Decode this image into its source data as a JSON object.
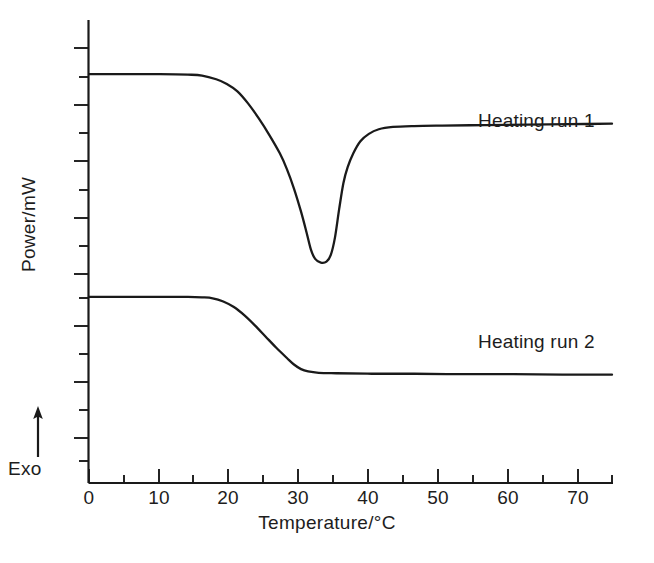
{
  "chart_data": {
    "type": "line",
    "title": "",
    "xlabel": "Temperature/°C",
    "ylabel": "Power/mW",
    "xlim": [
      0,
      74
    ],
    "ylim": [
      0,
      10
    ],
    "grid": false,
    "legend_position": "inline-right",
    "x_ticks": [
      0,
      10,
      20,
      30,
      40,
      50,
      60,
      70
    ],
    "x_tick_labels": [
      "0",
      "10",
      "20",
      "30",
      "40",
      "50",
      "60",
      "70"
    ],
    "x_minor_tick_interval": 5,
    "y_ticks_labeled": false,
    "y_tick_count": 17,
    "annotations": [
      {
        "text": "Exo",
        "icon": "up-arrow-icon",
        "meaning": "exothermic direction is upward"
      }
    ],
    "series": [
      {
        "name": "Heating run 1",
        "label": "Heating run 1",
        "color": "#1a1a1a",
        "points": [
          [
            0.0,
            8.83
          ],
          [
            5.0,
            8.83
          ],
          [
            10.0,
            8.83
          ],
          [
            14.0,
            8.82
          ],
          [
            16.0,
            8.8
          ],
          [
            18.0,
            8.72
          ],
          [
            19.5,
            8.62
          ],
          [
            21.0,
            8.46
          ],
          [
            22.5,
            8.2
          ],
          [
            24.0,
            7.88
          ],
          [
            25.5,
            7.52
          ],
          [
            27.0,
            7.12
          ],
          [
            28.0,
            6.78
          ],
          [
            29.0,
            6.36
          ],
          [
            30.0,
            5.86
          ],
          [
            30.8,
            5.4
          ],
          [
            31.4,
            5.04
          ],
          [
            32.0,
            4.84
          ],
          [
            32.8,
            4.76
          ],
          [
            33.6,
            4.78
          ],
          [
            34.2,
            4.92
          ],
          [
            34.8,
            5.3
          ],
          [
            35.4,
            5.92
          ],
          [
            36.0,
            6.48
          ],
          [
            36.6,
            6.82
          ],
          [
            37.4,
            7.12
          ],
          [
            38.4,
            7.38
          ],
          [
            39.6,
            7.54
          ],
          [
            41.0,
            7.64
          ],
          [
            43.0,
            7.69
          ],
          [
            46.0,
            7.71
          ],
          [
            50.0,
            7.72
          ],
          [
            56.0,
            7.73
          ],
          [
            62.0,
            7.74
          ],
          [
            68.0,
            7.75
          ],
          [
            74.0,
            7.76
          ]
        ]
      },
      {
        "name": "Heating run 2",
        "label": "Heating run 2",
        "color": "#1a1a1a",
        "points": [
          [
            0.0,
            4.02
          ],
          [
            5.0,
            4.02
          ],
          [
            10.0,
            4.02
          ],
          [
            14.0,
            4.02
          ],
          [
            16.0,
            4.01
          ],
          [
            17.5,
            3.99
          ],
          [
            19.0,
            3.92
          ],
          [
            20.5,
            3.8
          ],
          [
            22.0,
            3.62
          ],
          [
            23.5,
            3.4
          ],
          [
            25.0,
            3.16
          ],
          [
            26.5,
            2.92
          ],
          [
            28.0,
            2.7
          ],
          [
            29.0,
            2.56
          ],
          [
            30.0,
            2.46
          ],
          [
            31.0,
            2.41
          ],
          [
            32.5,
            2.38
          ],
          [
            35.0,
            2.37
          ],
          [
            40.0,
            2.36
          ],
          [
            46.0,
            2.36
          ],
          [
            53.0,
            2.35
          ],
          [
            60.0,
            2.35
          ],
          [
            67.0,
            2.34
          ],
          [
            74.0,
            2.34
          ]
        ]
      }
    ]
  }
}
